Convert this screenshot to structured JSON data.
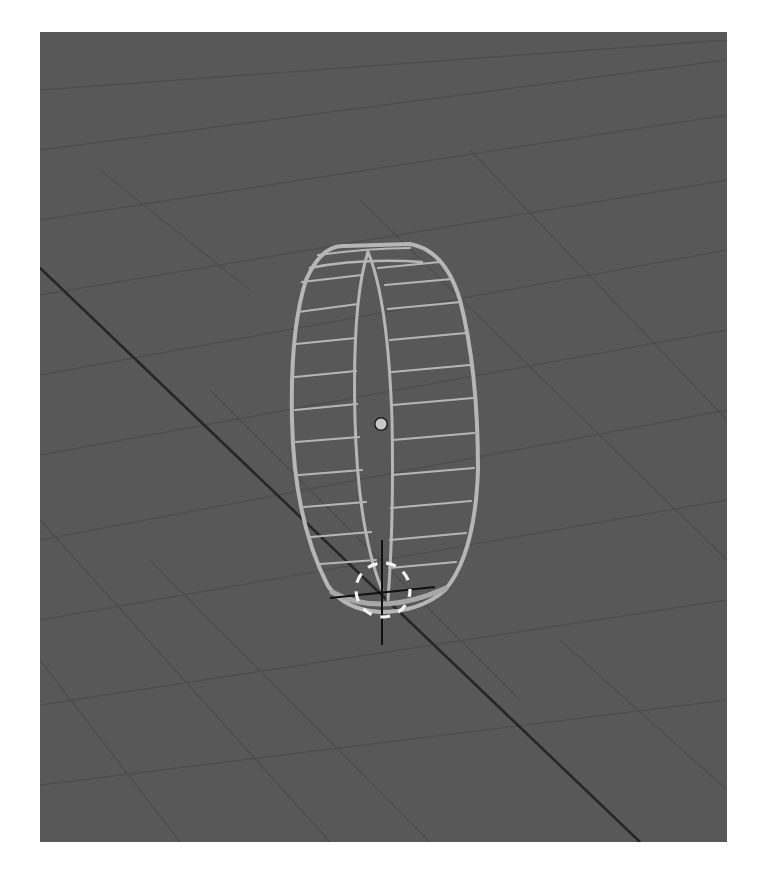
{
  "app": {
    "type": "3D viewport",
    "view": "perspective"
  },
  "viewport": {
    "background_color": "#585858",
    "grid_line_color": "#4b4b4b",
    "axis_line_color": "#2a2a2a",
    "wire_color": "#b4b4b4",
    "origin_color": "#c8c8c8",
    "cursor_ring_colors": [
      "#ffffff",
      "#d0d0d0"
    ],
    "cursor_cross_color": "#111111"
  },
  "scene": {
    "objects": [
      {
        "name": "cylinder-ring",
        "display": "wireframe",
        "segments_visible": 20
      }
    ],
    "origin_point": {
      "x": 381,
      "y": 424
    },
    "cursor_3d": {
      "x": 382,
      "y": 590
    }
  },
  "labels": {
    "viewport": "3D Viewport",
    "object": "Wireframe ring object",
    "origin": "Object origin",
    "cursor": "3D cursor"
  }
}
